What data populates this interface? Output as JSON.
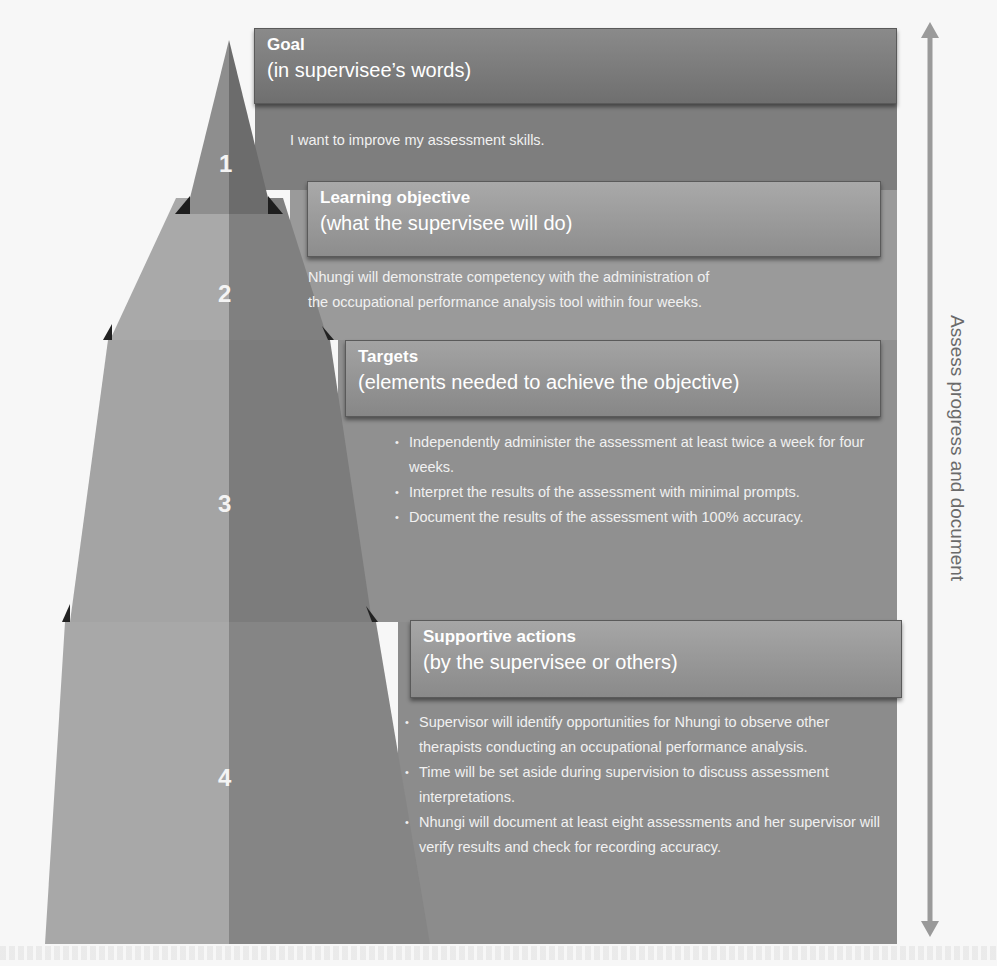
{
  "diagram": {
    "type": "pyramid",
    "tiers": [
      {
        "number": "1",
        "title": "Goal",
        "subtitle": "(in supervisee’s words)",
        "text": "I want to improve my assessment skills."
      },
      {
        "number": "2",
        "title": "Learning objective",
        "subtitle": "(what the supervisee will do)",
        "text_lines": [
          "Nhungi will demonstrate competency with the administration of",
          "the occupational performance analysis tool within four weeks."
        ]
      },
      {
        "number": "3",
        "title": "Targets",
        "subtitle": "(elements needed to achieve the objective)",
        "bullets": [
          "Independently administer the assessment at least twice a week for four weeks.",
          "Interpret the results of the assessment with minimal prompts.",
          "Document the results of the assessment with 100% accuracy."
        ]
      },
      {
        "number": "4",
        "title": "Supportive actions",
        "subtitle": "(by the supervisee or others)",
        "bullets": [
          "Supervisor will identify opportunities for Nhungi to observe other therapists conducting an occupational performance analysis.",
          "Time will be set aside during supervision to discuss assessment interpretations.",
          "Nhungi will document at least eight assessments and her supervisor will verify results and check for recording accuracy."
        ]
      }
    ],
    "side_arrow": {
      "label": "Assess progress and document",
      "direction": "bidirectional-vertical"
    },
    "colors": {
      "background": "#f7f7f7",
      "tier_light": "#a6a6a6",
      "tier_dark": "#7d7d7d",
      "panel": "#8d8d8d",
      "arrow": "#9a9a9a",
      "text_light": "#ffffff",
      "side_label": "#6a6a6a"
    }
  }
}
